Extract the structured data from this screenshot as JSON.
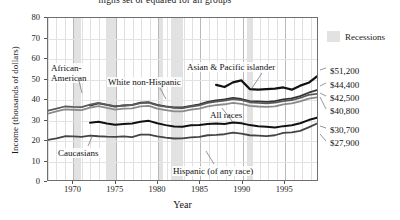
{
  "chart_data": {
    "type": "line",
    "title": "highs set or equaled for all groups",
    "xlabel": "Year",
    "ylabel": "Income (thousands of dollars)",
    "xlim": [
      1967,
      1999
    ],
    "ylim": [
      0,
      80
    ],
    "xticks": [
      "1970",
      "1975",
      "1980",
      "1985",
      "1990",
      "1995"
    ],
    "xtick_values": [
      1970,
      1975,
      1980,
      1985,
      1990,
      1995
    ],
    "yticks": [
      "0",
      "10",
      "20",
      "30",
      "40",
      "50",
      "60",
      "70",
      "80"
    ],
    "ytick_values": [
      0,
      10,
      20,
      30,
      40,
      50,
      60,
      70,
      80
    ],
    "grid": "vertical yearly, horizontal at each tick",
    "legend_position": "upper right, outside plot",
    "legend": [
      {
        "label": "Recessions",
        "color": "#e2e2e2",
        "type": "band"
      }
    ],
    "recessions": [
      {
        "start": 1969.9,
        "end": 1970.9
      },
      {
        "start": 1973.9,
        "end": 1975.2
      },
      {
        "start": 1980.0,
        "end": 1980.6
      },
      {
        "start": 1981.5,
        "end": 1982.9
      },
      {
        "start": 1990.5,
        "end": 1991.2
      }
    ],
    "x": [
      1967,
      1968,
      1969,
      1970,
      1971,
      1972,
      1973,
      1974,
      1975,
      1976,
      1977,
      1978,
      1979,
      1980,
      1981,
      1982,
      1983,
      1984,
      1985,
      1986,
      1987,
      1988,
      1989,
      1990,
      1991,
      1992,
      1993,
      1994,
      1995,
      1996,
      1997,
      1998,
      1999
    ],
    "series": [
      {
        "name": "Asian & Pacific islander",
        "end_label": "$51,200",
        "end_value": 51.2,
        "color": "#111111",
        "width": 2.2,
        "x_start": 1987,
        "values": [
          null,
          null,
          null,
          null,
          null,
          null,
          null,
          null,
          null,
          null,
          null,
          null,
          null,
          null,
          null,
          null,
          null,
          null,
          null,
          null,
          47.0,
          45.9,
          48.2,
          49.2,
          44.9,
          44.6,
          44.9,
          45.1,
          45.7,
          44.6,
          46.6,
          48.0,
          51.2
        ]
      },
      {
        "name": "White non-Hispanic",
        "end_label": "$44,400",
        "end_value": 44.4,
        "color": "#333333",
        "width": 1.8,
        "x_start": 1972,
        "values": [
          null,
          null,
          null,
          null,
          null,
          36.7,
          37.8,
          37.1,
          36.3,
          36.8,
          37.1,
          38.2,
          38.4,
          37.1,
          36.4,
          35.9,
          35.8,
          36.6,
          37.3,
          38.6,
          39.3,
          39.8,
          40.5,
          40.0,
          39.0,
          38.8,
          38.6,
          38.9,
          39.8,
          40.3,
          41.4,
          43.1,
          44.4
        ]
      },
      {
        "name": "Caucasians",
        "end_label": "$42,500",
        "end_value": 42.5,
        "color": "#5a5a5a",
        "width": 1.8,
        "values": [
          34.2,
          35.2,
          36.3,
          36.1,
          36.0,
          37.2,
          38.1,
          37.2,
          36.4,
          36.8,
          37.0,
          38.0,
          38.2,
          36.9,
          36.2,
          35.6,
          35.5,
          36.3,
          36.9,
          38.1,
          38.7,
          39.2,
          39.9,
          39.4,
          38.4,
          38.1,
          37.9,
          38.2,
          39.0,
          39.5,
          40.5,
          42.0,
          42.5
        ]
      },
      {
        "name": "All races",
        "end_label": "$40,800",
        "end_value": 40.8,
        "color": "#8a8a8a",
        "width": 1.8,
        "values": [
          32.8,
          33.9,
          34.9,
          34.7,
          34.5,
          35.7,
          36.5,
          35.6,
          34.8,
          35.2,
          35.4,
          36.4,
          36.6,
          35.2,
          34.5,
          33.9,
          33.9,
          34.7,
          35.3,
          36.4,
          37.0,
          37.4,
          38.1,
          37.6,
          36.6,
          36.3,
          36.1,
          36.4,
          37.3,
          37.8,
          38.8,
          40.2,
          40.8
        ]
      },
      {
        "name": "Hispanic (of any race)",
        "end_label": "$30,700",
        "end_value": 30.7,
        "color": "#111111",
        "width": 2.0,
        "x_start": 1972,
        "values": [
          null,
          null,
          null,
          null,
          null,
          28.3,
          28.8,
          27.9,
          27.3,
          27.6,
          27.9,
          28.8,
          29.2,
          28.0,
          27.1,
          26.4,
          26.3,
          27.0,
          27.2,
          27.6,
          27.9,
          27.7,
          28.4,
          28.0,
          27.1,
          26.6,
          26.3,
          25.9,
          26.6,
          27.0,
          28.0,
          29.6,
          30.7
        ]
      },
      {
        "name": "African-American",
        "end_label": "$27,900",
        "end_value": 27.9,
        "color": "#444444",
        "width": 1.8,
        "values": [
          19.8,
          20.6,
          21.6,
          21.5,
          21.3,
          21.9,
          21.6,
          21.4,
          21.3,
          21.5,
          21.2,
          22.4,
          22.4,
          21.5,
          20.9,
          20.5,
          20.6,
          21.0,
          21.3,
          22.1,
          22.3,
          22.6,
          23.4,
          22.9,
          22.1,
          21.9,
          21.7,
          22.1,
          23.3,
          23.5,
          24.3,
          26.0,
          27.9
        ]
      }
    ],
    "annotations": [
      {
        "name": "african-american-label",
        "text_line1": "African-",
        "text_line2": "American"
      },
      {
        "name": "white-non-hispanic-label",
        "text": "White non-Hispanic"
      },
      {
        "name": "asian-pacific-islander-label",
        "text": "Asian & Pacific islander"
      },
      {
        "name": "all-races-label",
        "text": "All races"
      },
      {
        "name": "caucasians-label",
        "text": "Caucasians"
      },
      {
        "name": "hispanic-label",
        "text": "Hispanic (of any race)"
      }
    ]
  }
}
